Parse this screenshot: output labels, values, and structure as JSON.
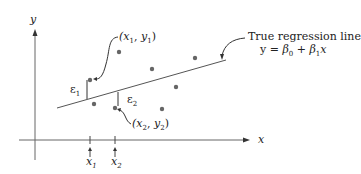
{
  "diagram": {
    "title_label": "True regression line",
    "equation": "y = β0 + β1x",
    "equation_parts": {
      "y": "y = ",
      "b0": "β",
      "b0_sub": "0",
      "plus": " + ",
      "b1": "β",
      "b1_sub": "1",
      "x": "x"
    },
    "axis_x_label": "x",
    "axis_y_label": "y",
    "point1_label": "(x1, y1)",
    "point2_label": "(x2, y2)",
    "error1_label": "ε1",
    "error2_label": "ε2",
    "tick1_label": "x1",
    "tick2_label": "x2",
    "colors": {
      "line": "#555555",
      "points": "#666666",
      "text": "#222222"
    }
  }
}
